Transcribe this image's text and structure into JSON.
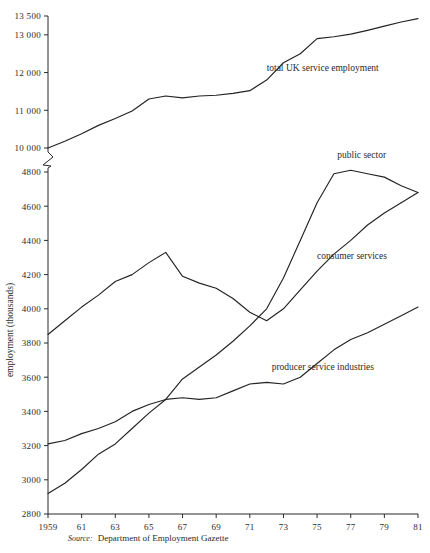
{
  "figure": {
    "ylabel": "employment (thousands)",
    "source_word": "Source:",
    "source_text": "Department of Employment Gazette",
    "title_fragment": ""
  },
  "chart_data": {
    "type": "line",
    "title": "",
    "xlabel": "",
    "ylabel": "employment (thousands)",
    "grid": false,
    "legend": "inline-labels",
    "axis_break": {
      "present": true,
      "between": [
        10000,
        4800
      ],
      "note": "y-axis is broken: upper panel 10000-13500, lower panel 2800-4800"
    },
    "x_tick_labels": [
      "1959",
      "61",
      "63",
      "65",
      "67",
      "69",
      "71",
      "73",
      "75",
      "77",
      "79",
      "81"
    ],
    "x_tick_values": [
      1959,
      1961,
      1963,
      1965,
      1967,
      1969,
      1971,
      1973,
      1975,
      1977,
      1979,
      1981
    ],
    "xlim": [
      1959,
      1981
    ],
    "upper_panel": {
      "y_tick_labels": [
        "10 000",
        "11 000",
        "12 000",
        "13 000",
        "13 500"
      ],
      "y_tick_values": [
        10000,
        11000,
        12000,
        13000,
        13500
      ],
      "ylim": [
        10000,
        13500
      ]
    },
    "lower_panel": {
      "y_tick_labels": [
        "2800",
        "3000",
        "3200",
        "3400",
        "3600",
        "3800",
        "4000",
        "4200",
        "4400",
        "4600",
        "4800"
      ],
      "y_tick_values": [
        2800,
        3000,
        3200,
        3400,
        3600,
        3800,
        4000,
        4200,
        4400,
        4600,
        4800
      ],
      "ylim": [
        2800,
        4800
      ]
    },
    "x": [
      1959,
      1960,
      1961,
      1962,
      1963,
      1964,
      1965,
      1966,
      1967,
      1968,
      1969,
      1970,
      1971,
      1972,
      1973,
      1974,
      1975,
      1976,
      1977,
      1978,
      1979,
      1980,
      1981
    ],
    "series": [
      {
        "name": "total UK service employment",
        "panel": "upper",
        "values": [
          10000,
          10180,
          10380,
          10600,
          10780,
          10980,
          11300,
          11380,
          11330,
          11380,
          11400,
          11450,
          11520,
          11800,
          12260,
          12500,
          12900,
          12950,
          13020,
          13120,
          13230,
          13340,
          13430
        ]
      },
      {
        "name": "public sector",
        "panel": "lower",
        "values": [
          2920,
          2980,
          3060,
          3150,
          3210,
          3300,
          3390,
          3470,
          3590,
          3660,
          3730,
          3810,
          3900,
          4000,
          4180,
          4400,
          4620,
          4790,
          4810,
          4790,
          4770,
          4720,
          4680
        ]
      },
      {
        "name": "consumer services",
        "panel": "lower",
        "values": [
          3850,
          3930,
          4010,
          4080,
          4160,
          4200,
          4270,
          4330,
          4190,
          4150,
          4120,
          4060,
          3980,
          3930,
          4000,
          4110,
          4220,
          4320,
          4400,
          4490,
          4560,
          4620,
          4680
        ]
      },
      {
        "name": "producer service industries",
        "panel": "lower",
        "values": [
          3210,
          3230,
          3270,
          3300,
          3340,
          3400,
          3440,
          3470,
          3480,
          3470,
          3480,
          3520,
          3560,
          3570,
          3560,
          3600,
          3680,
          3760,
          3820,
          3860,
          3910,
          3960,
          4010
        ]
      }
    ],
    "annotations": [
      {
        "text": "total UK service employment",
        "x": 1972.0,
        "value": 12050,
        "panel": "upper"
      },
      {
        "text": "public sector",
        "x": 1976.2,
        "value": 4880,
        "panel": "lower"
      },
      {
        "text": "consumer services",
        "x": 1975.0,
        "value": 4290,
        "panel": "lower"
      },
      {
        "text": "producer service industries",
        "x": 1972.3,
        "value": 3640,
        "panel": "lower"
      }
    ]
  }
}
